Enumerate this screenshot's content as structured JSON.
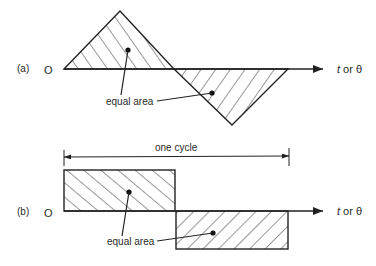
{
  "diagram": {
    "colors": {
      "stroke": "#222222",
      "hatch": "#333333",
      "text": "#2a2a2a",
      "background": "#ffffff"
    },
    "panel_a": {
      "label": "(a)",
      "origin_label": "O",
      "axis_label_t": "t",
      "axis_label_or": " or ",
      "axis_label_theta": "θ",
      "annotation": "equal area",
      "shape": "triangular wave (positive and negative triangles)"
    },
    "panel_b": {
      "label": "(b)",
      "origin_label": "O",
      "axis_label_t": "t",
      "axis_label_or": " or ",
      "axis_label_theta": "θ",
      "annotation": "equal area",
      "dimension_label": "one cycle",
      "shape": "square wave (positive and negative rectangles)"
    }
  }
}
